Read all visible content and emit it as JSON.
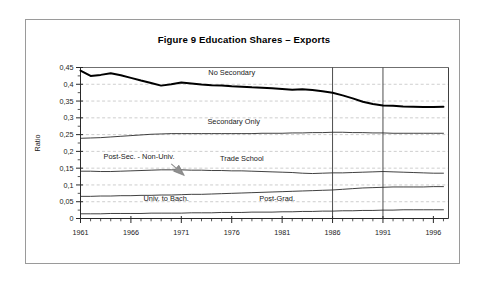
{
  "figure": {
    "title": "Figure 9  Education Shares – Exports"
  },
  "chart_data": {
    "type": "line",
    "title": "Figure 9  Education Shares – Exports",
    "xlabel": "",
    "ylabel": "Ratio",
    "xlim": [
      1961,
      1997.5
    ],
    "ylim": [
      0,
      0.45
    ],
    "ytick_labels": [
      "0",
      "0,05",
      "0,1",
      "0,15",
      "0,2",
      "0,25",
      "0,3",
      "0,35",
      "0,4",
      "0,45"
    ],
    "ytick_values": [
      0,
      0.05,
      0.1,
      0.15,
      0.2,
      0.25,
      0.3,
      0.35,
      0.4,
      0.45
    ],
    "ytick_minor_step": 0.025,
    "xtick_labels": [
      "1961",
      "1966",
      "1971",
      "1976",
      "1981",
      "1986",
      "1991",
      "1996"
    ],
    "xtick_values": [
      1961,
      1966,
      1971,
      1976,
      1981,
      1986,
      1991,
      1996
    ],
    "xtick_minor_step": 1,
    "grid": "horizontal-dashed-light-gray",
    "legend": "inline-annotations",
    "vertical_reference_lines": [
      1986,
      1991
    ],
    "x": [
      1961,
      1962,
      1963,
      1964,
      1965,
      1966,
      1967,
      1968,
      1969,
      1970,
      1971,
      1972,
      1973,
      1974,
      1975,
      1976,
      1977,
      1978,
      1979,
      1980,
      1981,
      1982,
      1983,
      1984,
      1985,
      1986,
      1987,
      1988,
      1989,
      1990,
      1991,
      1992,
      1993,
      1994,
      1995,
      1996,
      1997
    ],
    "series": [
      {
        "name": "No Secondary",
        "color": "#000000",
        "width": 2.0,
        "values": [
          0.441,
          0.425,
          0.428,
          0.433,
          0.427,
          0.419,
          0.411,
          0.404,
          0.396,
          0.4,
          0.405,
          0.402,
          0.399,
          0.397,
          0.396,
          0.394,
          0.393,
          0.391,
          0.39,
          0.388,
          0.386,
          0.384,
          0.385,
          0.383,
          0.379,
          0.375,
          0.367,
          0.358,
          0.348,
          0.341,
          0.337,
          0.336,
          0.334,
          0.333,
          0.332,
          0.332,
          0.333
        ]
      },
      {
        "name": "Secondary  Only",
        "color": "#2b2b2b",
        "width": 0.9,
        "values": [
          0.239,
          0.24,
          0.241,
          0.243,
          0.245,
          0.247,
          0.249,
          0.251,
          0.252,
          0.253,
          0.253,
          0.253,
          0.253,
          0.253,
          0.253,
          0.253,
          0.253,
          0.253,
          0.254,
          0.254,
          0.254,
          0.255,
          0.255,
          0.256,
          0.256,
          0.257,
          0.257,
          0.256,
          0.256,
          0.255,
          0.255,
          0.254,
          0.254,
          0.254,
          0.254,
          0.254,
          0.254
        ]
      },
      {
        "name": "Trade School",
        "color": "#2b2b2b",
        "width": 0.9,
        "values": [
          0.141,
          0.141,
          0.14,
          0.14,
          0.141,
          0.142,
          0.143,
          0.144,
          0.145,
          0.145,
          0.145,
          0.144,
          0.144,
          0.143,
          0.143,
          0.142,
          0.142,
          0.141,
          0.14,
          0.139,
          0.138,
          0.137,
          0.135,
          0.134,
          0.135,
          0.136,
          0.136,
          0.137,
          0.138,
          0.139,
          0.14,
          0.139,
          0.138,
          0.137,
          0.136,
          0.135,
          0.135
        ]
      },
      {
        "name": "Univ. to Bach.",
        "color": "#2b2b2b",
        "width": 0.9,
        "values": [
          0.066,
          0.066,
          0.067,
          0.067,
          0.068,
          0.068,
          0.069,
          0.069,
          0.07,
          0.07,
          0.071,
          0.072,
          0.072,
          0.073,
          0.074,
          0.075,
          0.076,
          0.077,
          0.078,
          0.079,
          0.08,
          0.081,
          0.082,
          0.083,
          0.084,
          0.085,
          0.087,
          0.089,
          0.091,
          0.092,
          0.093,
          0.094,
          0.094,
          0.094,
          0.094,
          0.095,
          0.095
        ]
      },
      {
        "name": "Post-Grad.",
        "color": "#2b2b2b",
        "width": 0.9,
        "values": [
          0.014,
          0.014,
          0.014,
          0.015,
          0.015,
          0.015,
          0.015,
          0.016,
          0.016,
          0.016,
          0.016,
          0.017,
          0.017,
          0.017,
          0.018,
          0.018,
          0.018,
          0.019,
          0.019,
          0.019,
          0.02,
          0.02,
          0.021,
          0.021,
          0.022,
          0.022,
          0.023,
          0.023,
          0.024,
          0.024,
          0.025,
          0.025,
          0.026,
          0.026,
          0.026,
          0.026,
          0.026
        ]
      }
    ],
    "annotations": [
      {
        "text": "No Secondary",
        "x": 1976.0,
        "y": 0.427,
        "anchor": "middle"
      },
      {
        "text": "Secondary  Only",
        "x": 1976.2,
        "y": 0.282,
        "anchor": "middle"
      },
      {
        "text": "Post-Sec. - Non-Univ.",
        "x": 1966.8,
        "y": 0.176,
        "anchor": "middle"
      },
      {
        "text": "Trade School",
        "x": 1977.0,
        "y": 0.172,
        "anchor": "middle"
      },
      {
        "text": "Univ. to Bach.",
        "x": 1969.5,
        "y": 0.052,
        "anchor": "middle"
      },
      {
        "text": "Post-Grad.",
        "x": 1980.5,
        "y": 0.052,
        "anchor": "middle"
      }
    ],
    "arrow": {
      "name": "post-sec-non-univ-pointer",
      "from": {
        "x": 1970.0,
        "y": 0.163
      },
      "to": {
        "x": 1971.3,
        "y": 0.128
      },
      "color": "#8f8f8f"
    }
  }
}
